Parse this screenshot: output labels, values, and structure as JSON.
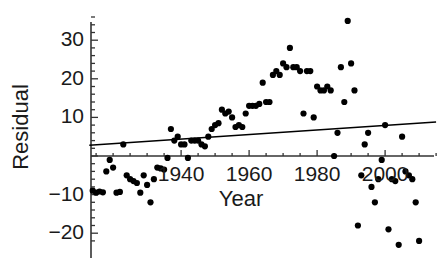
{
  "chart_data": {
    "type": "scatter",
    "title": "",
    "xlabel": "Year",
    "ylabel": "Residual",
    "xlim": [
      1913,
      2016
    ],
    "ylim": [
      -24,
      37
    ],
    "grid": false,
    "legend": "none",
    "xticks": [
      1940,
      1960,
      1980,
      2000
    ],
    "xtick_labels": [
      "1940",
      "1960",
      "1980",
      "2000"
    ],
    "yticks": [
      -20,
      -10,
      10,
      20,
      30
    ],
    "ytick_labels": [
      "−20",
      "−10",
      "10",
      "20",
      "30"
    ],
    "y_zero_axis": true,
    "marker": "filled-circle",
    "marker_color": "#000000",
    "points": [
      {
        "x": 1914,
        "y": -9
      },
      {
        "x": 1915,
        "y": -9.5
      },
      {
        "x": 1916,
        "y": -9.2
      },
      {
        "x": 1917,
        "y": -9.4
      },
      {
        "x": 1918,
        "y": -4
      },
      {
        "x": 1919,
        "y": -1
      },
      {
        "x": 1920,
        "y": -3
      },
      {
        "x": 1921,
        "y": -9.5
      },
      {
        "x": 1922,
        "y": -9.3
      },
      {
        "x": 1923,
        "y": 3
      },
      {
        "x": 1924,
        "y": -5
      },
      {
        "x": 1925,
        "y": -6
      },
      {
        "x": 1926,
        "y": -6.5
      },
      {
        "x": 1927,
        "y": -7
      },
      {
        "x": 1928,
        "y": -9.5
      },
      {
        "x": 1929,
        "y": -5
      },
      {
        "x": 1930,
        "y": -7.5
      },
      {
        "x": 1931,
        "y": -12
      },
      {
        "x": 1932,
        "y": -6
      },
      {
        "x": 1933,
        "y": -3
      },
      {
        "x": 1934,
        "y": -3.2
      },
      {
        "x": 1935,
        "y": -3.5
      },
      {
        "x": 1936,
        "y": -0.5
      },
      {
        "x": 1937,
        "y": 7
      },
      {
        "x": 1938,
        "y": 4
      },
      {
        "x": 1939,
        "y": 5
      },
      {
        "x": 1940,
        "y": 3
      },
      {
        "x": 1941,
        "y": 3
      },
      {
        "x": 1942,
        "y": -0.5
      },
      {
        "x": 1943,
        "y": 4
      },
      {
        "x": 1944,
        "y": 4
      },
      {
        "x": 1945,
        "y": 4
      },
      {
        "x": 1946,
        "y": 3
      },
      {
        "x": 1947,
        "y": 2.5
      },
      {
        "x": 1948,
        "y": 5
      },
      {
        "x": 1949,
        "y": 7
      },
      {
        "x": 1950,
        "y": 8
      },
      {
        "x": 1951,
        "y": 8.5
      },
      {
        "x": 1952,
        "y": 12
      },
      {
        "x": 1953,
        "y": 11
      },
      {
        "x": 1954,
        "y": 11.5
      },
      {
        "x": 1955,
        "y": 10
      },
      {
        "x": 1956,
        "y": 7.5
      },
      {
        "x": 1957,
        "y": 8
      },
      {
        "x": 1958,
        "y": 7.5
      },
      {
        "x": 1959,
        "y": 11
      },
      {
        "x": 1960,
        "y": 13
      },
      {
        "x": 1961,
        "y": 13
      },
      {
        "x": 1962,
        "y": 13
      },
      {
        "x": 1963,
        "y": 13.5
      },
      {
        "x": 1964,
        "y": 19
      },
      {
        "x": 1965,
        "y": 14
      },
      {
        "x": 1966,
        "y": 14
      },
      {
        "x": 1967,
        "y": 21
      },
      {
        "x": 1968,
        "y": 22
      },
      {
        "x": 1969,
        "y": 21
      },
      {
        "x": 1970,
        "y": 24
      },
      {
        "x": 1971,
        "y": 23
      },
      {
        "x": 1972,
        "y": 28
      },
      {
        "x": 1973,
        "y": 23
      },
      {
        "x": 1974,
        "y": 23
      },
      {
        "x": 1975,
        "y": 22
      },
      {
        "x": 1976,
        "y": 11
      },
      {
        "x": 1977,
        "y": 22
      },
      {
        "x": 1978,
        "y": 22
      },
      {
        "x": 1979,
        "y": 10
      },
      {
        "x": 1980,
        "y": 18
      },
      {
        "x": 1981,
        "y": 17
      },
      {
        "x": 1982,
        "y": 17
      },
      {
        "x": 1983,
        "y": 18
      },
      {
        "x": 1984,
        "y": 17
      },
      {
        "x": 1985,
        "y": 0
      },
      {
        "x": 1986,
        "y": 6
      },
      {
        "x": 1987,
        "y": 23
      },
      {
        "x": 1988,
        "y": 14
      },
      {
        "x": 1989,
        "y": 35
      },
      {
        "x": 1990,
        "y": 24
      },
      {
        "x": 1991,
        "y": 17
      },
      {
        "x": 1992,
        "y": -18
      },
      {
        "x": 1993,
        "y": -5
      },
      {
        "x": 1994,
        "y": 3
      },
      {
        "x": 1995,
        "y": 6
      },
      {
        "x": 1996,
        "y": -8
      },
      {
        "x": 1997,
        "y": -12
      },
      {
        "x": 1998,
        "y": -6
      },
      {
        "x": 1999,
        "y": -1
      },
      {
        "x": 2000,
        "y": 8
      },
      {
        "x": 2001,
        "y": -19
      },
      {
        "x": 2002,
        "y": -6
      },
      {
        "x": 2003,
        "y": -6.5
      },
      {
        "x": 2004,
        "y": -23
      },
      {
        "x": 2005,
        "y": 5
      },
      {
        "x": 2006,
        "y": -4
      },
      {
        "x": 2007,
        "y": -5
      },
      {
        "x": 2008,
        "y": -6
      },
      {
        "x": 2009,
        "y": -12
      },
      {
        "x": 2010,
        "y": -22
      }
    ],
    "trend_line": {
      "type": "line",
      "x": [
        1913,
        2015
      ],
      "y": [
        2.8,
        8.8
      ],
      "color": "#000000"
    }
  }
}
